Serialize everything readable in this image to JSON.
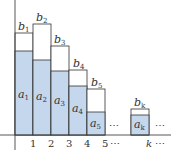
{
  "colors": {
    "fill_a": "#c5d7ec",
    "fill_b": "#ffffff",
    "stroke": "#333333",
    "axis": "#444444"
  },
  "axis": {
    "x_ticks": [
      "1",
      "2",
      "3",
      "4",
      "5",
      "k"
    ],
    "ellipsis": "⋯"
  },
  "bars": [
    {
      "a_label": "a",
      "a_sub": "1",
      "b_label": "b",
      "b_sub": "1"
    },
    {
      "a_label": "a",
      "a_sub": "2",
      "b_label": "b",
      "b_sub": "2"
    },
    {
      "a_label": "a",
      "a_sub": "3",
      "b_label": "b",
      "b_sub": "3"
    },
    {
      "a_label": "a",
      "a_sub": "4",
      "b_label": "b",
      "b_sub": "4"
    },
    {
      "a_label": "a",
      "a_sub": "5",
      "b_label": "b",
      "b_sub": "5"
    },
    {
      "a_label": "a",
      "a_sub": "k",
      "b_label": "b",
      "b_sub": "k"
    }
  ]
}
